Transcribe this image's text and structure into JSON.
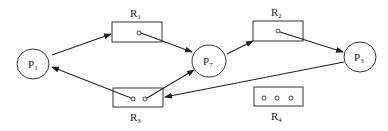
{
  "diagram": {
    "type": "resource-allocation-graph",
    "processes": [
      {
        "id": "P1",
        "label": "P",
        "sub": "1"
      },
      {
        "id": "P7",
        "label": "P",
        "sub": "7"
      },
      {
        "id": "P3",
        "label": "P",
        "sub": "3"
      }
    ],
    "resources": [
      {
        "id": "R1",
        "label": "R",
        "sub": "1",
        "instances": 1
      },
      {
        "id": "R2",
        "label": "R",
        "sub": "2",
        "instances": 1
      },
      {
        "id": "R3",
        "label": "R",
        "sub": "3",
        "instances": 2
      },
      {
        "id": "R4",
        "label": "R",
        "sub": "4",
        "instances": 3
      }
    ],
    "edges": [
      {
        "from": "P1",
        "to": "R1",
        "kind": "request"
      },
      {
        "from": "R1",
        "to": "P7",
        "kind": "assignment"
      },
      {
        "from": "P7",
        "to": "R2",
        "kind": "request"
      },
      {
        "from": "R2",
        "to": "P3",
        "kind": "assignment"
      },
      {
        "from": "P3",
        "to": "R3",
        "kind": "request"
      },
      {
        "from": "R3",
        "to": "P1",
        "kind": "assignment"
      },
      {
        "from": "R3",
        "to": "P7",
        "kind": "assignment"
      }
    ]
  }
}
